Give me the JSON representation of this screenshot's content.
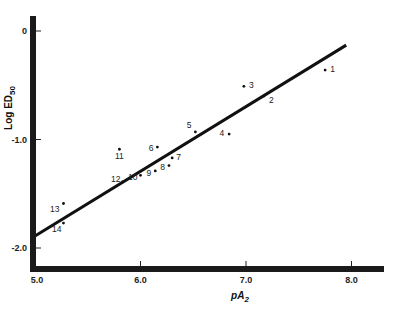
{
  "chart_data": {
    "type": "scatter",
    "title": "",
    "xlabel": "pA2",
    "ylabel": "Log ED50",
    "xlim": [
      5.0,
      8.3
    ],
    "ylim": [
      -2.2,
      0.1
    ],
    "x_ticks": [
      "5.0",
      "6.0",
      "7.0",
      "8.0"
    ],
    "y_ticks": [
      "0",
      "-1.0",
      "-2.0"
    ],
    "grid": false,
    "legend": null,
    "points": [
      {
        "label": "1",
        "x": 7.75,
        "y": -0.36
      },
      {
        "label": "2",
        "x": 7.17,
        "y": -0.6
      },
      {
        "label": "3",
        "x": 6.98,
        "y": -0.51
      },
      {
        "label": "4",
        "x": 6.84,
        "y": -0.95
      },
      {
        "label": "5",
        "x": 6.52,
        "y": -0.93
      },
      {
        "label": "6",
        "x": 6.16,
        "y": -1.07
      },
      {
        "label": "7",
        "x": 6.3,
        "y": -1.17
      },
      {
        "label": "8",
        "x": 6.27,
        "y": -1.24
      },
      {
        "label": "9",
        "x": 6.14,
        "y": -1.29
      },
      {
        "label": "10",
        "x": 6.0,
        "y": -1.33
      },
      {
        "label": "11",
        "x": 5.8,
        "y": -1.09
      },
      {
        "label": "12",
        "x": 5.83,
        "y": -1.39
      },
      {
        "label": "13",
        "x": 5.27,
        "y": -1.59
      },
      {
        "label": "14",
        "x": 5.27,
        "y": -1.77
      }
    ],
    "regression_line": {
      "x": [
        5.0,
        7.95
      ],
      "y": [
        -1.89,
        -0.13
      ]
    }
  },
  "axes": {
    "x_title_main": "pA",
    "x_title_sub": "2",
    "y_title_main": "Log ED",
    "y_title_sub": "50"
  }
}
